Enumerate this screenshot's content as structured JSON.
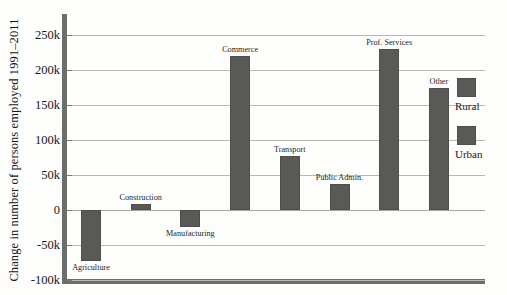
{
  "chart_data": {
    "type": "bar",
    "title": "",
    "xlabel": "",
    "ylabel": "Change in number of persons employed 1991–2011",
    "ylim": [
      -100000,
      280000
    ],
    "yticks": [
      {
        "value": 250000,
        "label": "250k"
      },
      {
        "value": 200000,
        "label": "200k"
      },
      {
        "value": 150000,
        "label": "150k"
      },
      {
        "value": 100000,
        "label": "100k"
      },
      {
        "value": 50000,
        "label": "50k"
      },
      {
        "value": 0,
        "label": "0"
      },
      {
        "value": -50000,
        "label": "-50k"
      },
      {
        "value": -100000,
        "label": "-100k"
      }
    ],
    "grid": true,
    "legend_position": "right",
    "categories": [
      "Agriculture",
      "Construction",
      "Manufacturing",
      "Commerce",
      "Transport",
      "Public Admin.",
      "Prof. Services",
      "Other"
    ],
    "values": [
      -73000,
      8000,
      -24000,
      220000,
      77000,
      37000,
      230000,
      175000
    ],
    "series": [
      {
        "name": "Rural",
        "values": [
          -73000,
          8000,
          -24000,
          220000,
          77000,
          37000,
          230000,
          175000
        ]
      }
    ],
    "bar_color": "#595957"
  },
  "legend": {
    "entries": [
      {
        "label": "Rural",
        "color": "#595957",
        "swatch": "legend-swatch-rural"
      },
      {
        "label": "Urban",
        "color": "#595957",
        "swatch": "legend-swatch-urban"
      }
    ]
  }
}
